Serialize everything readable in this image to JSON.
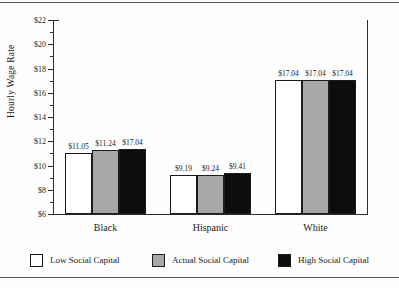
{
  "chart_data": {
    "type": "bar",
    "title": "",
    "xlabel": "",
    "ylabel": "Hourly Wage Rate",
    "categories": [
      "Black",
      "Hispanic",
      "White"
    ],
    "series": [
      {
        "name": "Low Social Capital",
        "key": "low",
        "color": "#ffffff",
        "values": [
          11.05,
          9.19,
          17.04
        ],
        "labels": [
          "$11.05",
          "$9.19",
          "$17.04"
        ]
      },
      {
        "name": "Actual Social Capital",
        "key": "actual",
        "color": "#a8a8a8",
        "values": [
          11.24,
          9.24,
          17.04
        ],
        "labels": [
          "$11.24",
          "$9.24",
          "$17.04"
        ]
      },
      {
        "name": "High Social Capital",
        "key": "high",
        "color": "#0d0d0d",
        "values": [
          11.39,
          9.41,
          17.04
        ],
        "labels": [
          "$17.04",
          "$9.41",
          "$17.04"
        ]
      }
    ],
    "ylim": [
      6,
      22
    ],
    "ytick_step": 2,
    "yticks": [
      6,
      8,
      10,
      12,
      14,
      16,
      18,
      20,
      22
    ],
    "ytick_labels": [
      "$6",
      "$8",
      "$10",
      "$12",
      "$14",
      "$16",
      "$18",
      "$20",
      "$22"
    ],
    "minor_ticks": true,
    "grid": false,
    "legend_position": "bottom",
    "legend": [
      "Low Social Capital",
      "Actual Social Capital",
      "High Social Capital"
    ]
  },
  "axis": {
    "y_title": "Hourly Wage Rate"
  },
  "legend": {
    "items": [
      {
        "label": "Low Social Capital"
      },
      {
        "label": "Actual Social Capital"
      },
      {
        "label": "High Social Capital"
      }
    ]
  }
}
